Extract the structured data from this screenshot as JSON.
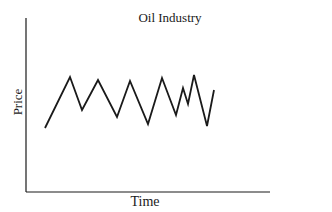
{
  "chart_data": {
    "type": "line",
    "title": "Oil Industry",
    "xlabel": "Time",
    "ylabel": "Price",
    "grid": false,
    "legend": null,
    "x_ticks": [],
    "y_ticks": [],
    "series": [
      {
        "name": "Price",
        "points_px": [
          [
            45,
            128
          ],
          [
            70,
            77
          ],
          [
            82,
            110
          ],
          [
            98,
            80
          ],
          [
            117,
            117
          ],
          [
            130,
            81
          ],
          [
            148,
            124
          ],
          [
            162,
            78
          ],
          [
            176,
            115
          ],
          [
            183,
            88
          ],
          [
            188,
            104
          ],
          [
            194,
            75
          ],
          [
            207,
            126
          ],
          [
            214,
            90
          ]
        ]
      }
    ],
    "axes": {
      "origin_px": [
        26,
        192
      ],
      "x_end_px": 270,
      "y_top_px": 18
    },
    "line_color": "#1a1a1a"
  }
}
